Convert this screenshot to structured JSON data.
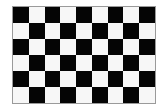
{
  "board": {
    "columns": 9,
    "rows": 6,
    "first_cell": "dark",
    "colors": {
      "dark": "#050505",
      "light": "#f7f7f7",
      "border": "#9a9a9a"
    }
  }
}
